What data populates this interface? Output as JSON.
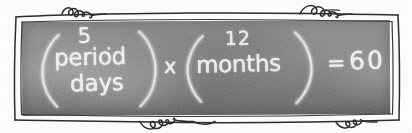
{
  "illustration": {
    "title": "Chalkboard equation sketch",
    "medium": "hand-drawn chalkboard with doodle frame",
    "board_color": "#7f7f7f",
    "chalk_color": "#f2f2ef",
    "ink_color": "#2c2c2c",
    "paper_color": "#fdfdfc"
  },
  "equation": {
    "plain_text": "( 5 period days ) x ( 12 months ) = 60",
    "group_one": {
      "open_paren": "(",
      "line_1": "5",
      "line_1_mark": ".",
      "line_2": "period",
      "line_3": "days",
      "close_paren": ")"
    },
    "operator_multiply": "x",
    "group_two": {
      "open_paren": "(",
      "line_1": "12",
      "line_2": "months",
      "close_paren": ")"
    },
    "operator_equals": "=",
    "result": "60"
  },
  "frame": {
    "style": "double hand-drawn rectangle with curly loop flourishes",
    "flourish_top_label": "curly-loops-top",
    "flourish_bottom_label": "curly-loops-bottom"
  }
}
